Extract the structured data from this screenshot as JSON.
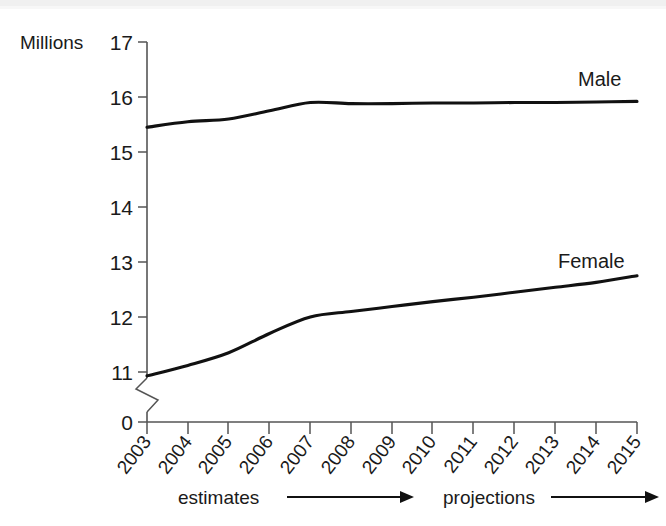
{
  "chart_data": {
    "type": "line",
    "title": "",
    "subtitle": "",
    "xlabel": "",
    "ylabel": "Millions",
    "x": [
      2003,
      2004,
      2005,
      2006,
      2007,
      2008,
      2009,
      2010,
      2011,
      2012,
      2013,
      2014,
      2015
    ],
    "categories": [
      "2003",
      "2004",
      "2005",
      "2006",
      "2007",
      "2008",
      "2009",
      "2010",
      "2011",
      "2012",
      "2013",
      "2014",
      "2015"
    ],
    "series": [
      {
        "name": "Male",
        "values": [
          15.45,
          15.55,
          15.6,
          15.75,
          15.9,
          15.88,
          15.88,
          15.89,
          15.89,
          15.9,
          15.9,
          15.91,
          15.92
        ]
      },
      {
        "name": "Female",
        "values": [
          10.93,
          11.12,
          11.35,
          11.7,
          12.0,
          12.1,
          12.19,
          12.28,
          12.36,
          12.45,
          12.54,
          12.63,
          12.75
        ]
      }
    ],
    "ylim": [
      11,
      17
    ],
    "yticks": [
      "17",
      "16",
      "15",
      "14",
      "13",
      "12",
      "11",
      "0"
    ],
    "axis_break": true,
    "axis_break_note": "y-axis broken between 0 and 11",
    "grid": false,
    "legend_position": "inline-right-of-series",
    "annotations": [
      {
        "text": "estimates",
        "span": "2003-2009",
        "arrow": "right"
      },
      {
        "text": "projections",
        "span": "2010-2015",
        "arrow": "right"
      }
    ]
  },
  "axis": {
    "unit_label": "Millions",
    "zero_label": "0"
  },
  "periods": {
    "estimates_label": "estimates",
    "projections_label": "projections"
  },
  "colors": {
    "line": "#111111",
    "axis": "#555555",
    "background": "#ffffff",
    "text": "#1a1a1a"
  }
}
